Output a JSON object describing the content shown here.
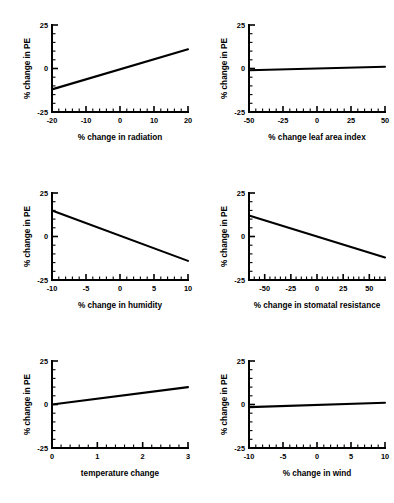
{
  "figure": {
    "title": "",
    "panel_count": 6,
    "layout": "2 columns x 3 rows",
    "shared_ylabel": "% change in PE"
  },
  "chart_data": [
    {
      "type": "line",
      "title": "",
      "xlabel": "% change in radiation",
      "ylabel": "% change in PE",
      "xlim": [
        -20,
        20
      ],
      "ylim": [
        -25,
        25
      ],
      "xticks": [
        -20,
        -10,
        0,
        10,
        20
      ],
      "xtick_labels": [
        "-20",
        "-10",
        "0",
        "10",
        "20"
      ],
      "yticks": [
        -25,
        0,
        25
      ],
      "ytick_labels": [
        "-25",
        "0",
        "25"
      ],
      "x": [
        -20,
        20
      ],
      "y": [
        -12,
        11
      ],
      "grid": false,
      "legend": "none"
    },
    {
      "type": "line",
      "title": "",
      "xlabel": "% change leaf area index",
      "ylabel": "% change in PE",
      "xlim": [
        -50,
        50
      ],
      "ylim": [
        -25,
        25
      ],
      "xticks": [
        -50,
        -25,
        0,
        25,
        50
      ],
      "xtick_labels": [
        "-50",
        "-25",
        "0",
        "25",
        "50"
      ],
      "yticks": [
        -25,
        0,
        25
      ],
      "ytick_labels": [
        "-25",
        "0",
        "25"
      ],
      "x": [
        -50,
        50
      ],
      "y": [
        -1,
        1
      ],
      "grid": false,
      "legend": "none"
    },
    {
      "type": "line",
      "title": "",
      "xlabel": "% change in humidity",
      "ylabel": "% change in PE",
      "xlim": [
        -10,
        10
      ],
      "ylim": [
        -25,
        25
      ],
      "xticks": [
        -10,
        -5,
        0,
        5,
        10
      ],
      "xtick_labels": [
        "-10",
        "-5",
        "0",
        "5",
        "10"
      ],
      "yticks": [
        -25,
        0,
        25
      ],
      "ytick_labels": [
        "-25",
        "0",
        "25"
      ],
      "x": [
        -10,
        10
      ],
      "y": [
        15,
        -14
      ],
      "grid": false,
      "legend": "none"
    },
    {
      "type": "line",
      "title": "",
      "xlabel": "% change in stomatal resistance",
      "ylabel": "% change in PE",
      "xlim": [
        -65,
        65
      ],
      "ylim": [
        -25,
        25
      ],
      "xticks": [
        -50,
        -25,
        0,
        25,
        50
      ],
      "xtick_labels": [
        "-50",
        "-25",
        "0",
        "25",
        "50"
      ],
      "yticks": [
        -25,
        0,
        25
      ],
      "ytick_labels": [
        "-25",
        "0",
        "25"
      ],
      "x": [
        -65,
        65
      ],
      "y": [
        12,
        -12
      ],
      "grid": false,
      "legend": "none"
    },
    {
      "type": "line",
      "title": "",
      "xlabel": "temperature change",
      "ylabel": "% change in PE",
      "xlim": [
        0,
        3
      ],
      "ylim": [
        -25,
        25
      ],
      "xticks": [
        0,
        1,
        2,
        3
      ],
      "xtick_labels": [
        "0",
        "1",
        "2",
        "3"
      ],
      "yticks": [
        -25,
        0,
        25
      ],
      "ytick_labels": [
        "-25",
        "0",
        "25"
      ],
      "x": [
        0,
        3
      ],
      "y": [
        0,
        10
      ],
      "grid": false,
      "legend": "none"
    },
    {
      "type": "line",
      "title": "",
      "xlabel": "% change in wind",
      "ylabel": "% change in PE",
      "xlim": [
        -10,
        10
      ],
      "ylim": [
        -25,
        25
      ],
      "xticks": [
        -10,
        -5,
        0,
        5,
        10
      ],
      "xtick_labels": [
        "-10",
        "-5",
        "0",
        "5",
        "10"
      ],
      "yticks": [
        -25,
        0,
        25
      ],
      "ytick_labels": [
        "-25",
        "0",
        "25"
      ],
      "x": [
        -10,
        10
      ],
      "y": [
        -1.5,
        1
      ],
      "grid": false,
      "legend": "none"
    }
  ],
  "colors": {
    "line": "#000000",
    "axis": "#000000",
    "background": "#ffffff"
  }
}
